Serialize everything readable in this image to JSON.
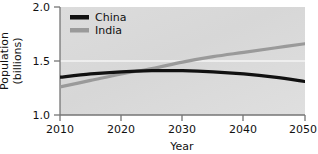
{
  "chart_data": {
    "type": "line",
    "title": "",
    "xlabel": "Year",
    "ylabel": "Population (billions)",
    "ylabel_line1": "Population",
    "ylabel_line2": "(billions)",
    "xlim": [
      2010,
      2050
    ],
    "ylim": [
      1.0,
      2.0
    ],
    "xticks": [
      "2010",
      "2020",
      "2030",
      "2040",
      "2050"
    ],
    "xtick_values": [
      2010,
      2020,
      2030,
      2040,
      2050
    ],
    "yticks": [
      "2.0",
      "1.5",
      "1.0"
    ],
    "ytick_values": [
      2.0,
      1.5,
      1.0
    ],
    "grid": "horizontal-white-at-1.5",
    "legend_position": "top-left-inside",
    "x": [
      2010,
      2015,
      2020,
      2025,
      2030,
      2035,
      2040,
      2045,
      2050
    ],
    "series": [
      {
        "name": "China",
        "color": "#111111",
        "values": [
          1.35,
          1.38,
          1.4,
          1.41,
          1.41,
          1.4,
          1.38,
          1.35,
          1.31
        ]
      },
      {
        "name": "India",
        "color": "#9a9a9a",
        "values": [
          1.26,
          1.32,
          1.38,
          1.43,
          1.49,
          1.54,
          1.58,
          1.62,
          1.66
        ]
      }
    ]
  },
  "legend": {
    "items": [
      {
        "label": "China",
        "swatch_color": "#111111"
      },
      {
        "label": "India",
        "swatch_color": "#9a9a9a"
      }
    ]
  },
  "axes": {
    "y_title_line1": "Population",
    "y_title_line2": "(billions)",
    "x_title": "Year",
    "y_tick_0": "2.0",
    "y_tick_1": "1.5",
    "y_tick_2": "1.0",
    "x_tick_0": "2010",
    "x_tick_1": "2020",
    "x_tick_2": "2030",
    "x_tick_3": "2040",
    "x_tick_4": "2050"
  },
  "colors": {
    "plot_background": "#d9d9d9",
    "figure_background": "#ffffff",
    "axis": "#6e6e6e",
    "gridline": "#f2f2f2",
    "china": "#111111",
    "india": "#9a9a9a",
    "text": "#111111"
  }
}
